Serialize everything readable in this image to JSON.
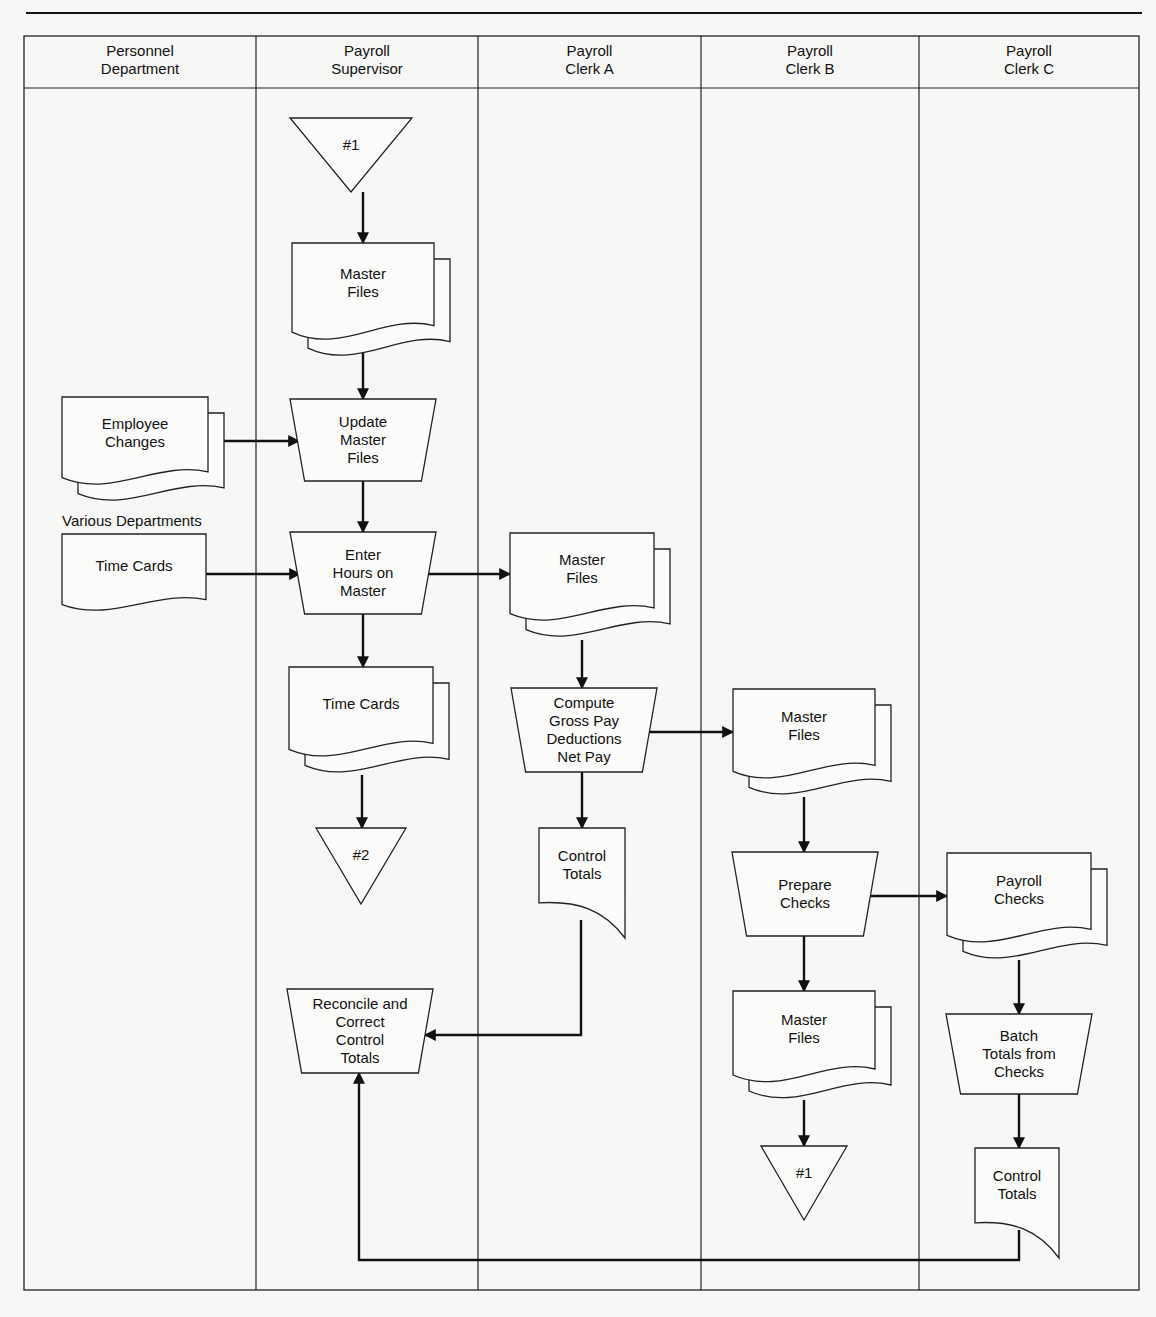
{
  "diagram": {
    "type": "swimlane-flowchart",
    "lanes": [
      {
        "id": "personnel",
        "label": [
          "Personnel",
          "Department"
        ],
        "x": 24,
        "w": 232
      },
      {
        "id": "supervisor",
        "label": [
          "Payroll",
          "Supervisor"
        ],
        "x": 256,
        "w": 222
      },
      {
        "id": "clerkA",
        "label": [
          "Payroll",
          "Clerk A"
        ],
        "x": 478,
        "w": 223
      },
      {
        "id": "clerkB",
        "label": [
          "Payroll",
          "Clerk B"
        ],
        "x": 701,
        "w": 218
      },
      {
        "id": "clerkC",
        "label": [
          "Payroll",
          "Clerk C"
        ],
        "x": 919,
        "w": 220
      }
    ],
    "annotations": [
      {
        "id": "various-departments",
        "text": "Various Departments",
        "x": 62,
        "y": 526
      }
    ],
    "nodes": [
      {
        "id": "conn1-top",
        "shape": "offpage-connector",
        "lines": [
          "#1"
        ],
        "x": 290,
        "y": 118,
        "w": 122,
        "h": 74
      },
      {
        "id": "master-files-1",
        "shape": "multi-document",
        "lines": [
          "Master",
          "Files"
        ],
        "x": 292,
        "y": 243,
        "w": 158,
        "h": 118
      },
      {
        "id": "employee-changes",
        "shape": "multi-document",
        "lines": [
          "Employee",
          "Changes"
        ],
        "x": 62,
        "y": 397,
        "w": 162,
        "h": 108
      },
      {
        "id": "update-master-files",
        "shape": "manual-operation",
        "lines": [
          "Update",
          "Master",
          "Files"
        ],
        "x": 290,
        "y": 399,
        "w": 146,
        "h": 82
      },
      {
        "id": "time-cards-in",
        "shape": "document",
        "lines": [
          "Time Cards"
        ],
        "x": 62,
        "y": 534,
        "w": 144,
        "h": 94
      },
      {
        "id": "enter-hours",
        "shape": "manual-operation",
        "lines": [
          "Enter",
          "Hours on",
          "Master"
        ],
        "x": 290,
        "y": 532,
        "w": 146,
        "h": 82
      },
      {
        "id": "master-files-2",
        "shape": "multi-document",
        "lines": [
          "Master",
          "Files"
        ],
        "x": 510,
        "y": 533,
        "w": 160,
        "h": 108
      },
      {
        "id": "time-cards-sup",
        "shape": "multi-document",
        "lines": [
          "Time Cards"
        ],
        "x": 289,
        "y": 667,
        "w": 160,
        "h": 110
      },
      {
        "id": "compute-gross-pay",
        "shape": "manual-operation",
        "lines": [
          "Compute",
          "Gross Pay",
          "Deductions",
          "Net Pay"
        ],
        "x": 511,
        "y": 688,
        "w": 146,
        "h": 84
      },
      {
        "id": "master-files-3",
        "shape": "multi-document",
        "lines": [
          "Master",
          "Files"
        ],
        "x": 733,
        "y": 689,
        "w": 158,
        "h": 110
      },
      {
        "id": "conn2",
        "shape": "offpage-connector",
        "lines": [
          "#2"
        ],
        "x": 316,
        "y": 828,
        "w": 90,
        "h": 76
      },
      {
        "id": "control-totals-a",
        "shape": "single-document-curl",
        "lines": [
          "Control",
          "Totals"
        ],
        "x": 539,
        "y": 828,
        "w": 86,
        "h": 110
      },
      {
        "id": "prepare-checks",
        "shape": "manual-operation",
        "lines": [
          "Prepare",
          "Checks"
        ],
        "x": 732,
        "y": 852,
        "w": 146,
        "h": 84
      },
      {
        "id": "payroll-checks",
        "shape": "multi-document",
        "lines": [
          "Payroll",
          "Checks"
        ],
        "x": 947,
        "y": 853,
        "w": 160,
        "h": 110
      },
      {
        "id": "reconcile",
        "shape": "manual-operation",
        "lines": [
          "Reconcile and",
          "Correct",
          "Control",
          "Totals"
        ],
        "x": 287,
        "y": 989,
        "w": 146,
        "h": 84
      },
      {
        "id": "batch-totals",
        "shape": "manual-operation",
        "lines": [
          "Batch",
          "Totals from",
          "Checks"
        ],
        "x": 946,
        "y": 1014,
        "w": 146,
        "h": 80
      },
      {
        "id": "master-files-4",
        "shape": "multi-document",
        "lines": [
          "Master",
          "Files"
        ],
        "x": 733,
        "y": 991,
        "w": 158,
        "h": 112
      },
      {
        "id": "conn1-bottom",
        "shape": "offpage-connector",
        "lines": [
          "#1"
        ],
        "x": 761,
        "y": 1146,
        "w": 86,
        "h": 74
      },
      {
        "id": "control-totals-c",
        "shape": "single-document-curl",
        "lines": [
          "Control",
          "Totals"
        ],
        "x": 975,
        "y": 1148,
        "w": 84,
        "h": 110
      }
    ],
    "edges": [
      {
        "from": "conn1-top",
        "to": "master-files-1",
        "points": [
          [
            363,
            192
          ],
          [
            363,
            243
          ]
        ]
      },
      {
        "from": "master-files-1",
        "to": "update-master-files",
        "points": [
          [
            363,
            350
          ],
          [
            363,
            399
          ]
        ]
      },
      {
        "from": "employee-changes",
        "to": "update-master-files",
        "points": [
          [
            224,
            441
          ],
          [
            299,
            441
          ]
        ]
      },
      {
        "from": "update-master-files",
        "to": "enter-hours",
        "points": [
          [
            363,
            481
          ],
          [
            363,
            532
          ]
        ]
      },
      {
        "from": "time-cards-in",
        "to": "enter-hours",
        "points": [
          [
            206,
            574
          ],
          [
            300,
            574
          ]
        ]
      },
      {
        "from": "enter-hours",
        "to": "master-files-2",
        "points": [
          [
            427,
            574
          ],
          [
            510,
            574
          ]
        ]
      },
      {
        "from": "enter-hours",
        "to": "time-cards-sup",
        "points": [
          [
            363,
            614
          ],
          [
            363,
            667
          ]
        ]
      },
      {
        "from": "master-files-2",
        "to": "compute-gross-pay",
        "points": [
          [
            582,
            640
          ],
          [
            582,
            688
          ]
        ]
      },
      {
        "from": "time-cards-sup",
        "to": "conn2",
        "points": [
          [
            362,
            775
          ],
          [
            362,
            828
          ]
        ]
      },
      {
        "from": "compute-gross-pay",
        "to": "master-files-3",
        "points": [
          [
            645,
            732
          ],
          [
            733,
            732
          ]
        ]
      },
      {
        "from": "compute-gross-pay",
        "to": "control-totals-a",
        "points": [
          [
            582,
            772
          ],
          [
            582,
            828
          ]
        ]
      },
      {
        "from": "master-files-3",
        "to": "prepare-checks",
        "points": [
          [
            804,
            797
          ],
          [
            804,
            852
          ]
        ]
      },
      {
        "from": "prepare-checks",
        "to": "payroll-checks",
        "points": [
          [
            866,
            896
          ],
          [
            947,
            896
          ]
        ]
      },
      {
        "from": "control-totals-a",
        "to": "reconcile",
        "points": [
          [
            581,
            920
          ],
          [
            581,
            1035
          ],
          [
            425,
            1035
          ]
        ]
      },
      {
        "from": "prepare-checks",
        "to": "master-files-4",
        "points": [
          [
            804,
            936
          ],
          [
            804,
            991
          ]
        ]
      },
      {
        "from": "payroll-checks",
        "to": "batch-totals",
        "points": [
          [
            1019,
            960
          ],
          [
            1019,
            1014
          ]
        ]
      },
      {
        "from": "master-files-4",
        "to": "conn1-bottom",
        "points": [
          [
            804,
            1100
          ],
          [
            804,
            1146
          ]
        ]
      },
      {
        "from": "batch-totals",
        "to": "control-totals-c",
        "points": [
          [
            1019,
            1094
          ],
          [
            1019,
            1148
          ]
        ]
      },
      {
        "from": "control-totals-c",
        "to": "reconcile",
        "points": [
          [
            1019,
            1230
          ],
          [
            1019,
            1260
          ],
          [
            359,
            1260
          ],
          [
            359,
            1073
          ]
        ]
      }
    ]
  },
  "colors": {
    "ink": "#111111",
    "paper": "#f7f7f5"
  }
}
